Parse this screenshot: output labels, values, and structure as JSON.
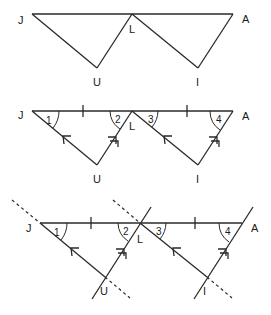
{
  "figures": [
    {
      "name": "figure-1-triangles",
      "labels": {
        "J": "J",
        "L": "L",
        "A": "A",
        "U": "U",
        "I": "I"
      }
    },
    {
      "name": "figure-2-marked-triangles",
      "labels": {
        "J": "J",
        "L": "L",
        "A": "A",
        "U": "U",
        "I": "I"
      },
      "angles": [
        "1",
        "2",
        "3",
        "4"
      ]
    },
    {
      "name": "figure-3-extended-lines",
      "labels": {
        "J": "J",
        "L": "L",
        "A": "A",
        "U": "U",
        "I": "I"
      },
      "angles": [
        "1",
        "2",
        "3",
        "4"
      ]
    }
  ]
}
